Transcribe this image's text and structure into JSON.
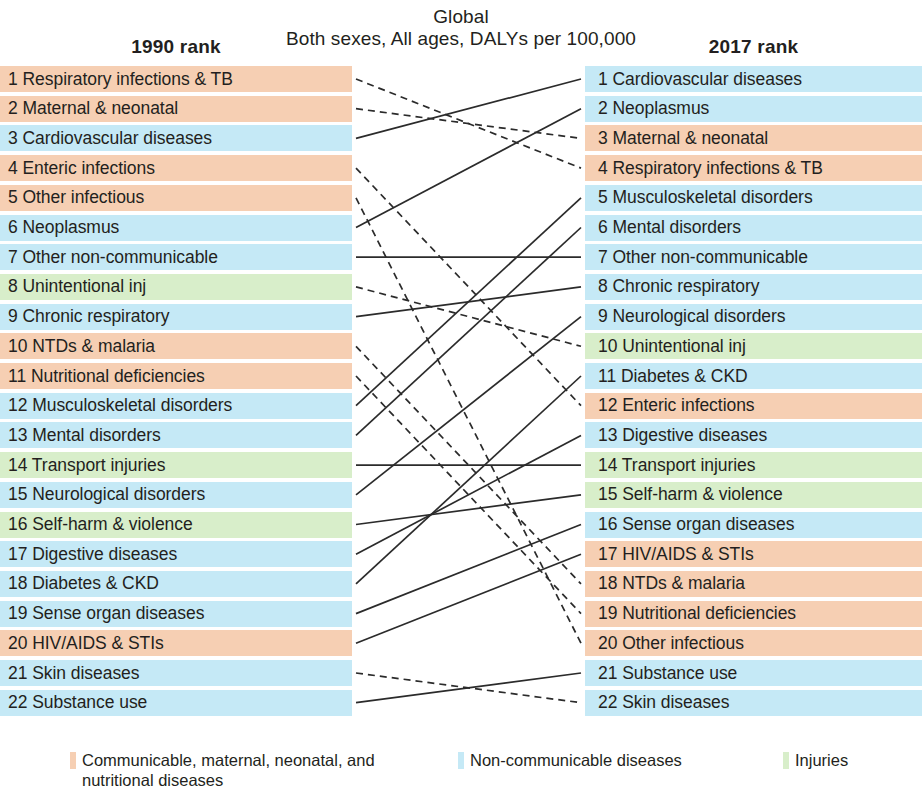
{
  "title": {
    "line1": "Global",
    "line2": "Both sexes, All ages, DALYs per 100,000"
  },
  "headers": {
    "left": "1990 rank",
    "right": "2017 rank"
  },
  "categories": {
    "cmnn": {
      "key": "cmnn",
      "color": "#f6cfb3",
      "label": "Communicable, maternal, neonatal, and nutritional diseases"
    },
    "ncd": {
      "key": "ncd",
      "color": "#c5e9f6",
      "label": "Non-communicable diseases"
    },
    "inj": {
      "key": "inj",
      "color": "#d8eeca",
      "label": "Injuries"
    }
  },
  "legend": [
    {
      "swatch": "#f6cfb3",
      "label": "Communicable, maternal, neonatal, and nutritional diseases"
    },
    {
      "swatch": "#c5e9f6",
      "label": "Non-communicable diseases"
    },
    {
      "swatch": "#d8eeca",
      "label": "Injuries"
    }
  ],
  "left_column": [
    {
      "rank": 1,
      "name": "Respiratory infections & TB",
      "label": "1 Respiratory infections & TB",
      "category": "cmnn"
    },
    {
      "rank": 2,
      "name": "Maternal & neonatal",
      "label": "2 Maternal & neonatal",
      "category": "cmnn"
    },
    {
      "rank": 3,
      "name": "Cardiovascular diseases",
      "label": "3 Cardiovascular diseases",
      "category": "ncd"
    },
    {
      "rank": 4,
      "name": "Enteric infections",
      "label": "4 Enteric infections",
      "category": "cmnn"
    },
    {
      "rank": 5,
      "name": "Other infectious",
      "label": "5 Other infectious",
      "category": "cmnn"
    },
    {
      "rank": 6,
      "name": "Neoplasmus",
      "label": "6 Neoplasmus",
      "category": "ncd"
    },
    {
      "rank": 7,
      "name": "Other non-communicable",
      "label": "7 Other non-communicable",
      "category": "ncd"
    },
    {
      "rank": 8,
      "name": "Unintentional inj",
      "label": "8 Unintentional inj",
      "category": "inj"
    },
    {
      "rank": 9,
      "name": "Chronic respiratory",
      "label": "9 Chronic respiratory",
      "category": "ncd"
    },
    {
      "rank": 10,
      "name": "NTDs & malaria",
      "label": "10 NTDs & malaria",
      "category": "cmnn"
    },
    {
      "rank": 11,
      "name": "Nutritional deficiencies",
      "label": "11 Nutritional deficiencies",
      "category": "cmnn"
    },
    {
      "rank": 12,
      "name": "Musculoskeletal disorders",
      "label": "12 Musculoskeletal disorders",
      "category": "ncd"
    },
    {
      "rank": 13,
      "name": "Mental disorders",
      "label": "13 Mental disorders",
      "category": "ncd"
    },
    {
      "rank": 14,
      "name": "Transport injuries",
      "label": "14 Transport injuries",
      "category": "inj"
    },
    {
      "rank": 15,
      "name": "Neurological disorders",
      "label": "15 Neurological disorders",
      "category": "ncd"
    },
    {
      "rank": 16,
      "name": "Self-harm & violence",
      "label": "16 Self-harm & violence",
      "category": "inj"
    },
    {
      "rank": 17,
      "name": "Digestive diseases",
      "label": "17 Digestive diseases",
      "category": "ncd"
    },
    {
      "rank": 18,
      "name": "Diabetes & CKD",
      "label": "18 Diabetes & CKD",
      "category": "ncd"
    },
    {
      "rank": 19,
      "name": "Sense organ diseases",
      "label": "19 Sense organ diseases",
      "category": "ncd"
    },
    {
      "rank": 20,
      "name": "HIV/AIDS & STIs",
      "label": "20 HIV/AIDS & STIs",
      "category": "cmnn"
    },
    {
      "rank": 21,
      "name": "Skin diseases",
      "label": "21 Skin diseases",
      "category": "ncd"
    },
    {
      "rank": 22,
      "name": "Substance use",
      "label": "22 Substance use",
      "category": "ncd"
    }
  ],
  "right_column": [
    {
      "rank": 1,
      "name": "Cardiovascular diseases",
      "label": "1 Cardiovascular diseases",
      "category": "ncd"
    },
    {
      "rank": 2,
      "name": "Neoplasmus",
      "label": "2 Neoplasmus",
      "category": "ncd"
    },
    {
      "rank": 3,
      "name": "Maternal & neonatal",
      "label": "3 Maternal & neonatal",
      "category": "cmnn"
    },
    {
      "rank": 4,
      "name": "Respiratory infections & TB",
      "label": "4 Respiratory infections & TB",
      "category": "cmnn"
    },
    {
      "rank": 5,
      "name": "Musculoskeletal disorders",
      "label": "5 Musculoskeletal disorders",
      "category": "ncd"
    },
    {
      "rank": 6,
      "name": "Mental disorders",
      "label": "6 Mental disorders",
      "category": "ncd"
    },
    {
      "rank": 7,
      "name": "Other non-communicable",
      "label": "7 Other non-communicable",
      "category": "ncd"
    },
    {
      "rank": 8,
      "name": "Chronic respiratory",
      "label": "8 Chronic respiratory",
      "category": "ncd"
    },
    {
      "rank": 9,
      "name": "Neurological disorders",
      "label": "9 Neurological disorders",
      "category": "ncd"
    },
    {
      "rank": 10,
      "name": "Unintentional inj",
      "label": "10 Unintentional inj",
      "category": "inj"
    },
    {
      "rank": 11,
      "name": "Diabetes & CKD",
      "label": "11 Diabetes & CKD",
      "category": "ncd"
    },
    {
      "rank": 12,
      "name": "Enteric infections",
      "label": "12 Enteric infections",
      "category": "cmnn"
    },
    {
      "rank": 13,
      "name": "Digestive diseases",
      "label": "13 Digestive diseases",
      "category": "ncd"
    },
    {
      "rank": 14,
      "name": "Transport injuries",
      "label": "14 Transport injuries",
      "category": "inj"
    },
    {
      "rank": 15,
      "name": "Self-harm & violence",
      "label": "15 Self-harm & violence",
      "category": "inj"
    },
    {
      "rank": 16,
      "name": "Sense organ diseases",
      "label": "16 Sense organ diseases",
      "category": "ncd"
    },
    {
      "rank": 17,
      "name": "HIV/AIDS & STIs",
      "label": "17 HIV/AIDS & STIs",
      "category": "cmnn"
    },
    {
      "rank": 18,
      "name": "NTDs & malaria",
      "label": "18 NTDs & malaria",
      "category": "cmnn"
    },
    {
      "rank": 19,
      "name": "Nutritional deficiencies",
      "label": "19 Nutritional deficiencies",
      "category": "cmnn"
    },
    {
      "rank": 20,
      "name": "Other infectious",
      "label": "20 Other infectious",
      "category": "cmnn"
    },
    {
      "rank": 21,
      "name": "Substance use",
      "label": "21 Substance use",
      "category": "ncd"
    },
    {
      "rank": 22,
      "name": "Skin diseases",
      "label": "22 Skin diseases",
      "category": "ncd"
    }
  ],
  "chart_data": {
    "type": "bump",
    "title": "Global",
    "subtitle": "Both sexes, All ages, DALYs per 100,000",
    "xlabel": "",
    "ylabel": "Rank",
    "x": [
      "1990 rank",
      "2017 rank"
    ],
    "ylim": [
      1,
      22
    ],
    "grid": false,
    "legend_position": "bottom",
    "line_styles": {
      "rank_improved_or_same": "solid",
      "rank_worsened": "dashed"
    },
    "series": [
      {
        "name": "Respiratory infections & TB",
        "category": "cmnn",
        "values": [
          1,
          4
        ],
        "change": -3
      },
      {
        "name": "Maternal & neonatal",
        "category": "cmnn",
        "values": [
          2,
          3
        ],
        "change": -1
      },
      {
        "name": "Cardiovascular diseases",
        "category": "ncd",
        "values": [
          3,
          1
        ],
        "change": 2
      },
      {
        "name": "Enteric infections",
        "category": "cmnn",
        "values": [
          4,
          12
        ],
        "change": -8
      },
      {
        "name": "Other infectious",
        "category": "cmnn",
        "values": [
          5,
          20
        ],
        "change": -15
      },
      {
        "name": "Neoplasmus",
        "category": "ncd",
        "values": [
          6,
          2
        ],
        "change": 4
      },
      {
        "name": "Other non-communicable",
        "category": "ncd",
        "values": [
          7,
          7
        ],
        "change": 0
      },
      {
        "name": "Unintentional inj",
        "category": "inj",
        "values": [
          8,
          10
        ],
        "change": -2
      },
      {
        "name": "Chronic respiratory",
        "category": "ncd",
        "values": [
          9,
          8
        ],
        "change": 1
      },
      {
        "name": "NTDs & malaria",
        "category": "cmnn",
        "values": [
          10,
          18
        ],
        "change": -8
      },
      {
        "name": "Nutritional deficiencies",
        "category": "cmnn",
        "values": [
          11,
          19
        ],
        "change": -8
      },
      {
        "name": "Musculoskeletal disorders",
        "category": "ncd",
        "values": [
          12,
          5
        ],
        "change": 7
      },
      {
        "name": "Mental disorders",
        "category": "ncd",
        "values": [
          13,
          6
        ],
        "change": 7
      },
      {
        "name": "Transport injuries",
        "category": "inj",
        "values": [
          14,
          14
        ],
        "change": 0
      },
      {
        "name": "Neurological disorders",
        "category": "ncd",
        "values": [
          15,
          9
        ],
        "change": 6
      },
      {
        "name": "Self-harm & violence",
        "category": "inj",
        "values": [
          16,
          15
        ],
        "change": 1
      },
      {
        "name": "Digestive diseases",
        "category": "ncd",
        "values": [
          17,
          13
        ],
        "change": 4
      },
      {
        "name": "Diabetes & CKD",
        "category": "ncd",
        "values": [
          18,
          11
        ],
        "change": 7
      },
      {
        "name": "Sense organ diseases",
        "category": "ncd",
        "values": [
          19,
          16
        ],
        "change": 3
      },
      {
        "name": "HIV/AIDS & STIs",
        "category": "cmnn",
        "values": [
          20,
          17
        ],
        "change": 3
      },
      {
        "name": "Skin diseases",
        "category": "ncd",
        "values": [
          21,
          22
        ],
        "change": -1
      },
      {
        "name": "Substance use",
        "category": "ncd",
        "values": [
          22,
          21
        ],
        "change": 1
      }
    ]
  }
}
